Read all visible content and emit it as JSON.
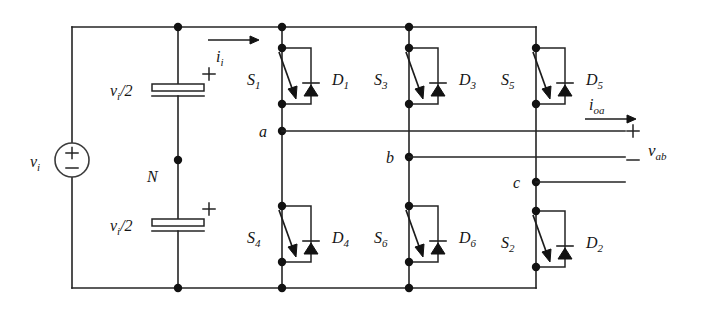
{
  "figure": {
    "type": "circuit-schematic",
    "background": "#ffffff",
    "ink_color": "#242424"
  },
  "source": {
    "name": "dc-voltage-source",
    "label": "v",
    "label_sub": "i",
    "plus": "+",
    "minus": "−"
  },
  "capacitors": [
    {
      "name": "upper-capacitor",
      "label": "v",
      "label_sub": "i",
      "label_tail": "/2",
      "polarity": "+"
    },
    {
      "name": "lower-capacitor",
      "label": "v",
      "label_sub": "i",
      "label_tail": "/2",
      "polarity": "+"
    }
  ],
  "midpoint": {
    "name": "neutral-node",
    "label": "N"
  },
  "input_current": {
    "name": "input-current-arrow",
    "label": "i",
    "label_sub": "i"
  },
  "output_current": {
    "name": "output-current-arrow",
    "label": "i",
    "label_sub": "oa"
  },
  "output_voltage": {
    "name": "output-voltage-label",
    "plus": "+",
    "minus": "−",
    "label": "v",
    "label_sub": "ab"
  },
  "phase_nodes": [
    {
      "name": "phase-node-a",
      "label": "a"
    },
    {
      "name": "phase-node-b",
      "label": "b"
    },
    {
      "name": "phase-node-c",
      "label": "c"
    }
  ],
  "legs": [
    {
      "name": "leg-a",
      "upper_switch": {
        "label": "S",
        "sub": "1"
      },
      "upper_diode": {
        "label": "D",
        "sub": "1"
      },
      "lower_switch": {
        "label": "S",
        "sub": "4"
      },
      "lower_diode": {
        "label": "D",
        "sub": "4"
      }
    },
    {
      "name": "leg-b",
      "upper_switch": {
        "label": "S",
        "sub": "3"
      },
      "upper_diode": {
        "label": "D",
        "sub": "3"
      },
      "lower_switch": {
        "label": "S",
        "sub": "6"
      },
      "lower_diode": {
        "label": "D",
        "sub": "6"
      }
    },
    {
      "name": "leg-c",
      "upper_switch": {
        "label": "S",
        "sub": "5"
      },
      "upper_diode": {
        "label": "D",
        "sub": "5"
      },
      "lower_switch": {
        "label": "S",
        "sub": "2"
      },
      "lower_diode": {
        "label": "D",
        "sub": "2"
      }
    }
  ]
}
